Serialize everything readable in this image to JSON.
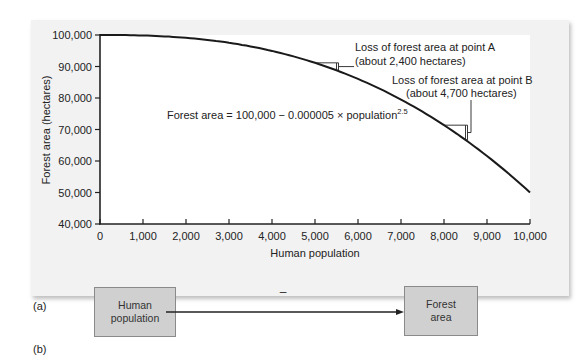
{
  "chart_data": {
    "type": "line",
    "title": "",
    "xlabel": "Human population",
    "ylabel": "Forest area (hectares)",
    "xlim": [
      0,
      10000
    ],
    "ylim": [
      40000,
      100000
    ],
    "x_ticks": [
      "0",
      "1,000",
      "2,000",
      "3,000",
      "4,000",
      "5,000",
      "6,000",
      "7,000",
      "8,000",
      "9,000",
      "10,000"
    ],
    "y_ticks": [
      "40,000",
      "50,000",
      "60,000",
      "70,000",
      "80,000",
      "90,000",
      "100,000"
    ],
    "grid": false,
    "legend": null,
    "series": [
      {
        "name": "Forest area",
        "formula": "Forest area = 100,000 − 0.000005 × population^2.5",
        "x": [
          0,
          1000,
          2000,
          3000,
          4000,
          5000,
          6000,
          7000,
          8000,
          9000,
          10000
        ],
        "values": [
          100000,
          99842,
          99106,
          97402,
          94800,
          91161,
          86364,
          79497,
          71378,
          61555,
          50000
        ]
      }
    ],
    "annotations": [
      {
        "text": "Forest area = 100,000 − 0.000005 × population",
        "superscript": "2.5"
      },
      {
        "point": "A",
        "line1": "Loss of forest area at point A",
        "line2": "(about 2,400 hectares)",
        "x_range": [
          5000,
          5500
        ]
      },
      {
        "point": "B",
        "line1": "Loss of forest area at point B",
        "line2": "(about 4,700 hectares)",
        "x_range": [
          8000,
          8500
        ]
      }
    ]
  },
  "panel_labels": {
    "a": "(a)",
    "b": "(b)"
  },
  "diagram": {
    "source_box": "Human population",
    "source_line1": "Human",
    "source_line2": "population",
    "target_line1": "Forest",
    "target_line2": "area",
    "relation_sign": "–"
  }
}
